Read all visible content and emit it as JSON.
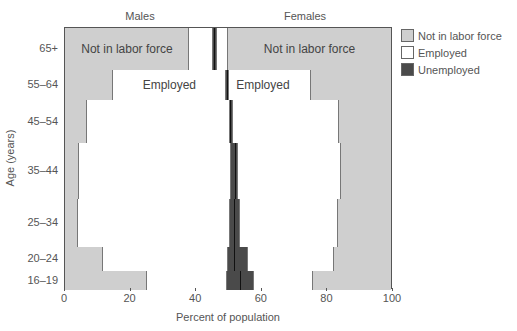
{
  "chart_data": {
    "type": "bar",
    "subtype": "stacked-horizontal-mosaic",
    "title": "",
    "panel_titles": {
      "left": "Males",
      "right": "Females"
    },
    "xlabel": "Percent of population",
    "ylabel": "Age (years)",
    "xlim": [
      0,
      100
    ],
    "x_ticks": [
      0,
      20,
      40,
      60,
      80,
      100
    ],
    "grid": false,
    "legend_position": "right",
    "legend": [
      {
        "key": "nlf",
        "label": "Not in labor force",
        "color": "#cfcfcf"
      },
      {
        "key": "emp",
        "label": "Employed",
        "color": "#ffffff"
      },
      {
        "key": "unemp",
        "label": "Unemployed",
        "color": "#4a4a4a"
      }
    ],
    "categories": [
      "65+",
      "55–64",
      "45–54",
      "35–44",
      "25–34",
      "20–24",
      "16–19"
    ],
    "row_heights_px": [
      42,
      30,
      43,
      56,
      48,
      24,
      19
    ],
    "note": "Cumulative boundaries along the 0-100 axis: male not in labor force, male employed, male unemployed, female unemployed, female employed, female not in labor force (ends at 100).",
    "rows": [
      {
        "age": "65+",
        "male_nlf_end": 38,
        "male_emp_end": 45.5,
        "male_unemp_end": 46,
        "female_unemp_end": 46.5,
        "female_emp_end": 50,
        "labels": {
          "male": "Not in labor force",
          "male_segment": "nlf",
          "female": "Not in labor force",
          "female_segment": "nlf"
        }
      },
      {
        "age": "55–64",
        "male_nlf_end": 14.6,
        "male_emp_end": 49.4,
        "male_unemp_end": 50,
        "female_unemp_end": 50.3,
        "female_emp_end": 75.6,
        "labels": {
          "male": "Employed",
          "male_segment": "emp",
          "female": "Employed",
          "female_segment": "emp"
        }
      },
      {
        "age": "45–54",
        "male_nlf_end": 6.7,
        "male_emp_end": 50.5,
        "male_unemp_end": 51,
        "female_unemp_end": 51.4,
        "female_emp_end": 84,
        "labels": {}
      },
      {
        "age": "35–44",
        "male_nlf_end": 4.3,
        "male_emp_end": 51,
        "male_unemp_end": 52.4,
        "female_unemp_end": 53.2,
        "female_emp_end": 84.8,
        "labels": {}
      },
      {
        "age": "25–34",
        "male_nlf_end": 4,
        "male_emp_end": 50.6,
        "male_unemp_end": 52.1,
        "female_unemp_end": 53.7,
        "female_emp_end": 83.8,
        "labels": {}
      },
      {
        "age": "20–24",
        "male_nlf_end": 11.6,
        "male_emp_end": 50,
        "male_unemp_end": 52.1,
        "female_unemp_end": 56,
        "female_emp_end": 82.6,
        "labels": {}
      },
      {
        "age": "16–19",
        "male_nlf_end": 25,
        "male_emp_end": 49.7,
        "male_unemp_end": 54,
        "female_unemp_end": 58,
        "female_emp_end": 76,
        "labels": {}
      }
    ]
  }
}
